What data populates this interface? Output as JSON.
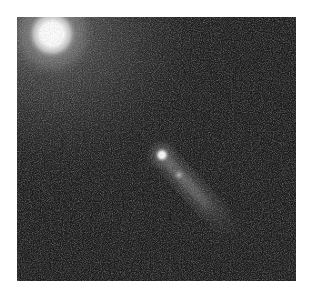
{
  "image": {
    "subject": "comet",
    "colors": {
      "page_background": "#ffffff",
      "sky_background": "#1c1c1c",
      "glow_tint": "#5a5a5a",
      "star_core": "#ffffff"
    },
    "objects": [
      {
        "name": "bright-star",
        "cx": 35,
        "cy": 17,
        "r": 22
      },
      {
        "name": "comet-head",
        "cx": 145,
        "cy": 138,
        "r": 6
      },
      {
        "name": "comet-knot",
        "cx": 162,
        "cy": 158,
        "r": 4
      },
      {
        "name": "comet-tail",
        "from": [
          145,
          138
        ],
        "to": [
          216,
          216
        ]
      }
    ]
  }
}
